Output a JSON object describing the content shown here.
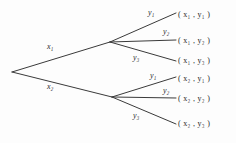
{
  "diagram": {
    "type": "tree",
    "title": "",
    "background_color": "#fdfdfd",
    "line_color": "#3a3a3a",
    "text_color": "#2b2b2b",
    "root": {
      "x": 12,
      "y": 72
    },
    "level1_nodes": [
      {
        "id": "x1-node",
        "x": 110,
        "y": 42,
        "edge_label": "x₁"
      },
      {
        "id": "x2-node",
        "x": 112,
        "y": 97,
        "edge_label": "x₂"
      }
    ],
    "edge_labels": {
      "x1": "x₁",
      "x2": "x₂",
      "upper_y1": "y₁",
      "upper_y2": "y₂",
      "upper_y3": "y₃",
      "lower_y1": "y₁",
      "lower_y2": "y₂",
      "lower_y3": "y₃"
    },
    "leaves": [
      {
        "id": "leaf-x1-y1",
        "text": "( x₁ , y₁ )",
        "x": 178,
        "y": 11
      },
      {
        "id": "leaf-x1-y2",
        "text": "( x₁ , y₂ )",
        "x": 178,
        "y": 37
      },
      {
        "id": "leaf-x1-y3",
        "text": "( x₁ , y₃ )",
        "x": 178,
        "y": 57
      },
      {
        "id": "leaf-x2-y1",
        "text": "( x₂ , y₁ )",
        "x": 178,
        "y": 75
      },
      {
        "id": "leaf-x2-y2",
        "text": "( x₂ , y₂ )",
        "x": 178,
        "y": 95
      },
      {
        "id": "leaf-x2-y3",
        "text": "( x₂ , y₃ )",
        "x": 178,
        "y": 120
      }
    ]
  }
}
